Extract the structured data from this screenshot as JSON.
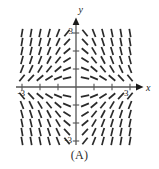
{
  "figure": {
    "caption": "(A)",
    "axes": {
      "x_label": "x",
      "y_label": "y",
      "x_tick_labels": [
        "-3",
        "3"
      ],
      "y_tick_labels": [
        "3",
        "-3"
      ],
      "x_min": -3.6,
      "x_max": 3.6,
      "y_min": -3.6,
      "y_max": 3.6,
      "tick_positions": [
        -3,
        -2,
        -1,
        1,
        2,
        3
      ],
      "axis_color": "#555555",
      "arrow_color": "#1a1a1a"
    },
    "slope_field": {
      "type": "slope-field",
      "equation_form": "dy/dx = -x*y",
      "mark_color": "#2a2a2a",
      "grid_x": [
        -3.0,
        -2.5,
        -2.0,
        -1.5,
        -1.0,
        -0.5,
        0.5,
        1.0,
        1.5,
        2.0,
        2.5,
        3.0
      ],
      "grid_y": [
        3.0,
        2.5,
        2.0,
        1.5,
        1.0,
        0.5,
        -0.5,
        -1.0,
        -1.5,
        -2.0,
        -2.5,
        -3.0
      ],
      "quadrant_slope_sign": {
        "I": "negative",
        "II": "positive",
        "III": "negative",
        "IV": "positive"
      },
      "slope_scale": 0.42,
      "max_abs_slope": 6.0,
      "segment_length": 8.5
    }
  },
  "chart_data": {
    "type": "scatter",
    "title": "",
    "xlabel": "x",
    "ylabel": "y",
    "xlim": [
      -3.6,
      3.6
    ],
    "ylim": [
      -3.6,
      3.6
    ],
    "grid": false,
    "legend": null,
    "annotations": [
      "(A)"
    ],
    "x_ticks": [
      -3,
      -2,
      -1,
      1,
      2,
      3
    ],
    "y_ticks": [
      -3,
      -2,
      -1,
      1,
      2,
      3
    ],
    "x_tick_labels": [
      "-3",
      "",
      "",
      "",
      "",
      "3"
    ],
    "y_tick_labels": [
      "-3",
      "",
      "",
      "",
      "",
      "3"
    ]
  }
}
